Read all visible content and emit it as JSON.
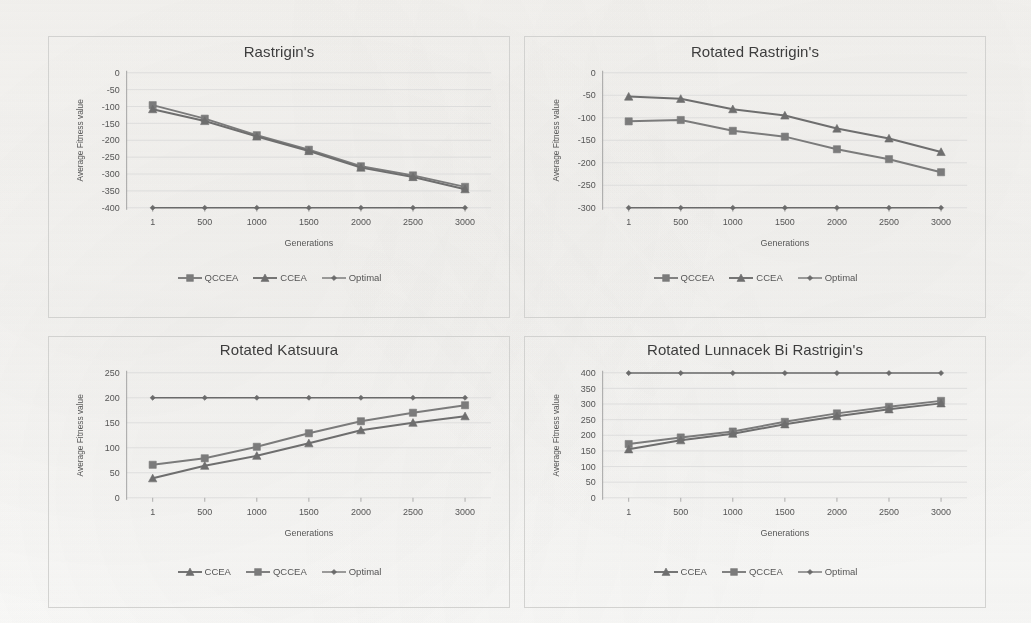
{
  "page": {
    "background_color": "#fbfbfa",
    "series_colors": {
      "QCCEA": "#7b7b7b",
      "CCEA": "#6e6e6e",
      "Optimal": "#6a6a6a"
    },
    "axis_color": "#9a9a9a",
    "grid_color": "#d9d9d9"
  },
  "charts": [
    {
      "id": "rastrigins",
      "title": "Rastrigin's",
      "xlabel": "Generations",
      "ylabel": "Average Fitness value",
      "legend": [
        {
          "label": "QCCEA",
          "marker": "square"
        },
        {
          "label": "CCEA",
          "marker": "triangle"
        },
        {
          "label": "Optimal",
          "marker": "diamond"
        }
      ],
      "chart_data": {
        "type": "line",
        "title": "Rastrigin's",
        "xlabel": "Generations",
        "ylabel": "Average Fitness value",
        "x": [
          1,
          500,
          1000,
          1500,
          2000,
          2500,
          3000
        ],
        "xtick_labels": [
          "1",
          "500",
          "1000",
          "1500",
          "2000",
          "2500",
          "3000"
        ],
        "ylim": [
          -400,
          0
        ],
        "yticks": [
          0,
          -50,
          -100,
          -150,
          -200,
          -250,
          -300,
          -350,
          -400
        ],
        "ytick_labels": [
          "0",
          "-50",
          "-100",
          "-150",
          "-200",
          "-250",
          "-300",
          "-350",
          "-400"
        ],
        "grid": true,
        "legend_position": "bottom",
        "series": [
          {
            "name": "QCCEA",
            "marker": "square",
            "values": [
              -96,
              -136,
              -185,
              -228,
              -277,
              -304,
              -338
            ]
          },
          {
            "name": "CCEA",
            "marker": "triangle",
            "values": [
              -108,
              -143,
              -189,
              -232,
              -281,
              -309,
              -345
            ]
          },
          {
            "name": "Optimal",
            "marker": "diamond",
            "values": [
              -400,
              -400,
              -400,
              -400,
              -400,
              -400,
              -400
            ]
          }
        ]
      }
    },
    {
      "id": "rotated-rastrigins",
      "title": "Rotated Rastrigin's",
      "xlabel": "Generations",
      "ylabel": "Average Fitness value",
      "legend": [
        {
          "label": "QCCEA",
          "marker": "square"
        },
        {
          "label": "CCEA",
          "marker": "triangle"
        },
        {
          "label": "Optimal",
          "marker": "diamond"
        }
      ],
      "chart_data": {
        "type": "line",
        "title": "Rotated Rastrigin's",
        "xlabel": "Generations",
        "ylabel": "Average Fitness value",
        "x": [
          1,
          500,
          1000,
          1500,
          2000,
          2500,
          3000
        ],
        "xtick_labels": [
          "1",
          "500",
          "1000",
          "1500",
          "2000",
          "2500",
          "3000"
        ],
        "ylim": [
          -300,
          0
        ],
        "yticks": [
          0,
          -50,
          -100,
          -150,
          -200,
          -250,
          -300
        ],
        "ytick_labels": [
          "0",
          "-50",
          "-100",
          "-150",
          "-200",
          "-250",
          "-300"
        ],
        "grid": true,
        "legend_position": "bottom",
        "series": [
          {
            "name": "CCEA",
            "marker": "triangle",
            "values": [
              -53,
              -58,
              -81,
              -95,
              -124,
              -146,
              -176
            ]
          },
          {
            "name": "QCCEA",
            "marker": "square",
            "values": [
              -108,
              -105,
              -129,
              -142,
              -170,
              -192,
              -221
            ]
          },
          {
            "name": "Optimal",
            "marker": "diamond",
            "values": [
              -300,
              -300,
              -300,
              -300,
              -300,
              -300,
              -300
            ]
          }
        ]
      }
    },
    {
      "id": "rotated-katsuura",
      "title": "Rotated Katsuura",
      "xlabel": "Generations",
      "ylabel": "Average Fitness value",
      "legend": [
        {
          "label": "CCEA",
          "marker": "triangle"
        },
        {
          "label": "QCCEA",
          "marker": "square"
        },
        {
          "label": "Optimal",
          "marker": "diamond"
        }
      ],
      "chart_data": {
        "type": "line",
        "title": "Rotated Katsuura",
        "xlabel": "Generations",
        "ylabel": "Average Fitness value",
        "x": [
          1,
          500,
          1000,
          1500,
          2000,
          2500,
          3000
        ],
        "xtick_labels": [
          "1",
          "500",
          "1000",
          "1500",
          "2000",
          "2500",
          "3000"
        ],
        "ylim": [
          0,
          250
        ],
        "yticks": [
          0,
          50,
          100,
          150,
          200,
          250
        ],
        "ytick_labels": [
          "0",
          "50",
          "100",
          "150",
          "200",
          "250"
        ],
        "grid": true,
        "legend_position": "bottom",
        "series": [
          {
            "name": "QCCEA",
            "marker": "square",
            "values": [
              66,
              79,
              102,
              129,
              153,
              170,
              185
            ]
          },
          {
            "name": "CCEA",
            "marker": "triangle",
            "values": [
              39,
              64,
              84,
              109,
              135,
              150,
              163
            ]
          },
          {
            "name": "Optimal",
            "marker": "diamond",
            "values": [
              200,
              200,
              200,
              200,
              200,
              200,
              200
            ]
          }
        ]
      }
    },
    {
      "id": "rotated-lunnacek-bi-rastrigins",
      "title": "Rotated Lunnacek Bi Rastrigin's",
      "xlabel": "Generations",
      "ylabel": "Average Fitness value",
      "legend": [
        {
          "label": "CCEA",
          "marker": "triangle"
        },
        {
          "label": "QCCEA",
          "marker": "square"
        },
        {
          "label": "Optimal",
          "marker": "diamond"
        }
      ],
      "chart_data": {
        "type": "line",
        "title": "Rotated Lunnacek Bi Rastrigin's",
        "xlabel": "Generations",
        "ylabel": "Average Fitness value",
        "x": [
          1,
          500,
          1000,
          1500,
          2000,
          2500,
          3000
        ],
        "xtick_labels": [
          "1",
          "500",
          "1000",
          "1500",
          "2000",
          "2500",
          "3000"
        ],
        "ylim": [
          0,
          400
        ],
        "yticks": [
          0,
          50,
          100,
          150,
          200,
          250,
          300,
          350,
          400
        ],
        "ytick_labels": [
          "0",
          "50",
          "100",
          "150",
          "200",
          "250",
          "300",
          "350",
          "400"
        ],
        "grid": true,
        "legend_position": "bottom",
        "series": [
          {
            "name": "QCCEA",
            "marker": "square",
            "values": [
              172,
              193,
              212,
              243,
              270,
              291,
              310
            ]
          },
          {
            "name": "CCEA",
            "marker": "triangle",
            "values": [
              155,
              184,
              205,
              235,
              261,
              283,
              302
            ]
          },
          {
            "name": "Optimal",
            "marker": "diamond",
            "values": [
              399,
              399,
              399,
              399,
              399,
              399,
              399
            ]
          }
        ]
      }
    }
  ]
}
